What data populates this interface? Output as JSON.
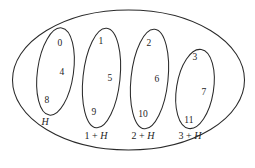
{
  "figure": {
    "name": "coset-partition-diagram",
    "background_color": "#ffffff",
    "stroke_color": "#2a2a2a",
    "text_color": "#1d1d1d",
    "outer_group_label": "Z12",
    "cosets": [
      {
        "id": "H",
        "label": "H",
        "label_prefix": "",
        "label_has_plus": false,
        "elements": [
          "0",
          "4",
          "8"
        ]
      },
      {
        "id": "1+H",
        "label": "1 + H",
        "label_prefix": "1",
        "label_has_plus": true,
        "elements": [
          "1",
          "5",
          "9"
        ]
      },
      {
        "id": "2+H",
        "label": "2 + H",
        "label_prefix": "2",
        "label_has_plus": true,
        "elements": [
          "2",
          "6",
          "10"
        ]
      },
      {
        "id": "3+H",
        "label": "3 + H",
        "label_prefix": "3",
        "label_has_plus": true,
        "elements": [
          "3",
          "7",
          "11"
        ]
      }
    ],
    "subgroup_letter": "H",
    "plus_sign": "+"
  }
}
